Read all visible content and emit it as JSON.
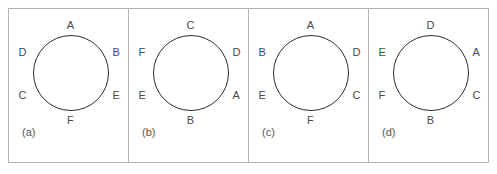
{
  "figure": {
    "type": "circle-vertex-labeling-diagram",
    "panel_count": 4,
    "stroke_color": "#2b2b2b",
    "frame_color": "#b3b3b3",
    "label_color": "#4a4a4a",
    "background": "#ffffff"
  },
  "panels": [
    {
      "caption": "(a)",
      "labels": {
        "top": "A",
        "upper_right": "B",
        "lower_right": "E",
        "bottom": "F",
        "lower_left": "C",
        "upper_left": "D"
      },
      "clockwise_order": [
        "A",
        "B",
        "E",
        "F",
        "C",
        "D"
      ]
    },
    {
      "caption": "(b)",
      "labels": {
        "top": "C",
        "upper_right": "D",
        "lower_right": "A",
        "bottom": "B",
        "lower_left": "E",
        "upper_left": "F"
      },
      "clockwise_order": [
        "C",
        "D",
        "A",
        "B",
        "E",
        "F"
      ]
    },
    {
      "caption": "(c)",
      "labels": {
        "top": "A",
        "upper_right": "D",
        "lower_right": "C",
        "bottom": "F",
        "lower_left": "E",
        "upper_left": "B"
      },
      "clockwise_order": [
        "A",
        "D",
        "C",
        "F",
        "E",
        "B"
      ]
    },
    {
      "caption": "(d)",
      "labels": {
        "top": "D",
        "upper_right": "A",
        "lower_right": "C",
        "bottom": "B",
        "lower_left": "F",
        "upper_left": "E"
      },
      "clockwise_order": [
        "D",
        "A",
        "C",
        "B",
        "F",
        "E"
      ]
    }
  ]
}
